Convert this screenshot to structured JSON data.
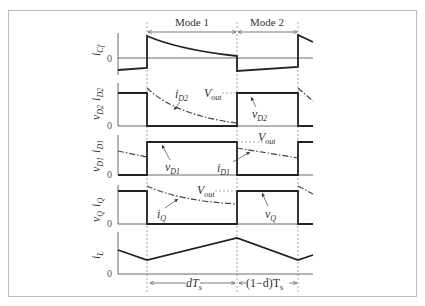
{
  "header": {
    "mode1_label": "Mode 1",
    "mode2_label": "Mode 2"
  },
  "panels": [
    {
      "id": "icf",
      "ylabel_main": "i",
      "ylabel_sub": "Cf",
      "zero": "0"
    },
    {
      "id": "d2",
      "ylabel_v": "v",
      "ylabel_v_sub": "D2",
      "ylabel_i": "i",
      "ylabel_i_sub": "D2",
      "zero": "0",
      "annot_i": "i",
      "annot_i_sub": "D2",
      "annot_v": "v",
      "annot_v_sub": "D2",
      "vout": "V",
      "vout_sub": "out"
    },
    {
      "id": "d1",
      "ylabel_v": "v",
      "ylabel_v_sub": "D1",
      "ylabel_i": "i",
      "ylabel_i_sub": "D1",
      "zero": "0",
      "annot_i": "i",
      "annot_i_sub": "D1",
      "annot_v": "v",
      "annot_v_sub": "D1",
      "vout": "V",
      "vout_sub": "out"
    },
    {
      "id": "q",
      "ylabel_v": "v",
      "ylabel_v_sub": "Q",
      "ylabel_i": "i",
      "ylabel_i_sub": "Q",
      "zero": "0",
      "annot_i": "i",
      "annot_i_sub": "Q",
      "annot_v": "v",
      "annot_v_sub": "Q",
      "vout": "V",
      "vout_sub": "out"
    },
    {
      "id": "il",
      "ylabel_main": "i",
      "ylabel_sub": "L",
      "zero": "0"
    }
  ],
  "footer": {
    "dts": "dT",
    "dts_sub": "s",
    "one_minus_d": "(1−d)T",
    "one_minus_d_sub": "s"
  }
}
